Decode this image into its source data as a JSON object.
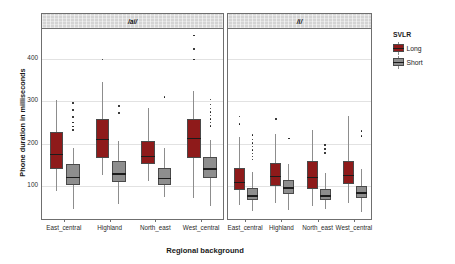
{
  "chart_data": {
    "type": "boxplot",
    "title": "",
    "xlabel": "Regional background",
    "ylabel": "Phone duration in milliseconds",
    "ylim": [
      20,
      470
    ],
    "yticks": [
      100,
      200,
      300,
      400
    ],
    "grid": true,
    "legend": {
      "title": "SVLR",
      "position": "right",
      "entries": [
        {
          "name": "Long",
          "color": "#8e1a1a"
        },
        {
          "name": "Short",
          "color": "#8e8e8e"
        }
      ]
    },
    "facets": [
      {
        "label": "/ai/",
        "categories": [
          "East_central",
          "Highland",
          "North_east",
          "West_central"
        ],
        "groups": [
          {
            "name": "Long",
            "color": "#8e1a1a",
            "boxes": [
              {
                "category": "East_central",
                "whisker_low": 88,
                "q1": 141,
                "median": 176,
                "q3": 228,
                "whisker_high": 302,
                "outliers": []
              },
              {
                "category": "Highland",
                "whisker_low": 126,
                "q1": 166,
                "median": 212,
                "q3": 258,
                "whisker_high": 345,
                "outliers": [
                  398
                ]
              },
              {
                "category": "North_east",
                "whisker_low": 113,
                "q1": 151,
                "median": 171,
                "q3": 205,
                "whisker_high": 284,
                "outliers": []
              },
              {
                "category": "West_central",
                "whisker_low": 73,
                "q1": 166,
                "median": 213,
                "q3": 258,
                "whisker_high": 323,
                "outliers": [
                  455,
                  423,
                  398
                ]
              }
            ]
          },
          {
            "name": "Short",
            "color": "#8e8e8e",
            "boxes": [
              {
                "category": "East_central",
                "whisker_low": 45,
                "q1": 103,
                "median": 122,
                "q3": 151,
                "whisker_high": 190,
                "outliers": [
                  296,
                  279,
                  263,
                  250,
                  240,
                  232
                ]
              },
              {
                "category": "Highland",
                "whisker_low": 57,
                "q1": 110,
                "median": 130,
                "q3": 159,
                "whisker_high": 205,
                "outliers": [
                  288,
                  272
                ]
              },
              {
                "category": "North_east",
                "whisker_low": 75,
                "q1": 103,
                "median": 120,
                "q3": 143,
                "whisker_high": 190,
                "outliers": [
                  310
                ]
              },
              {
                "category": "West_central",
                "whisker_low": 54,
                "q1": 118,
                "median": 142,
                "q3": 168,
                "whisker_high": 208,
                "outliers": [
                  304,
                  292,
                  283,
                  274,
                  266,
                  258,
                  250,
                  242
                ]
              }
            ]
          }
        ]
      },
      {
        "label": "/i/",
        "categories": [
          "East_central",
          "Highland",
          "North_east",
          "West_central"
        ],
        "groups": [
          {
            "name": "Long",
            "color": "#8e1a1a",
            "boxes": [
              {
                "category": "East_central",
                "whisker_low": 56,
                "q1": 90,
                "median": 110,
                "q3": 142,
                "whisker_high": 215,
                "outliers": [
                  264,
                  246
                ]
              },
              {
                "category": "Highland",
                "whisker_low": 60,
                "q1": 99,
                "median": 124,
                "q3": 155,
                "whisker_high": 222,
                "outliers": [
                  258
                ]
              },
              {
                "category": "North_east",
                "whisker_low": 54,
                "q1": 93,
                "median": 122,
                "q3": 158,
                "whisker_high": 232,
                "outliers": []
              },
              {
                "category": "West_central",
                "whisker_low": 59,
                "q1": 104,
                "median": 127,
                "q3": 158,
                "whisker_high": 264,
                "outliers": []
              }
            ]
          },
          {
            "name": "Short",
            "color": "#8e8e8e",
            "boxes": [
              {
                "category": "East_central",
                "whisker_low": 41,
                "q1": 66,
                "median": 78,
                "q3": 96,
                "whisker_high": 134,
                "outliers": [
                  220,
                  210,
                  201,
                  193,
                  185,
                  177,
                  170,
                  163
                ]
              },
              {
                "category": "Highland",
                "whisker_low": 44,
                "q1": 82,
                "median": 97,
                "q3": 115,
                "whisker_high": 152,
                "outliers": [
                  212
                ]
              },
              {
                "category": "North_east",
                "whisker_low": 45,
                "q1": 68,
                "median": 78,
                "q3": 92,
                "whisker_high": 130,
                "outliers": [
                  197,
                  187,
                  178
                ]
              },
              {
                "category": "West_central",
                "whisker_low": 40,
                "q1": 71,
                "median": 85,
                "q3": 101,
                "whisker_high": 140,
                "outliers": [
                  229,
                  218
                ]
              }
            ]
          }
        ]
      }
    ]
  }
}
